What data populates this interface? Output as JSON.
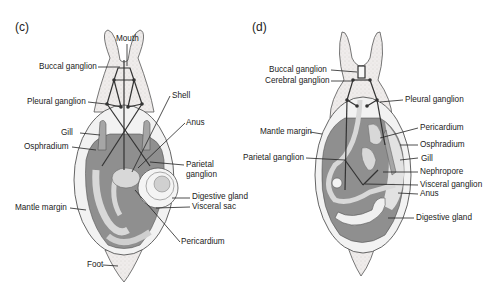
{
  "colors": {
    "body_fill": "#ece9e6",
    "mantle_dark": "#8a8a8a",
    "mantle_light": "#d6d6d6",
    "line": "#222222",
    "nerve": "#333333"
  },
  "panels": [
    {
      "id": "c",
      "label": "(c)",
      "labels": {
        "mouth": "Mouth",
        "buccal_ganglion": "Buccal ganglion",
        "pleural_ganglion": "Pleural ganglion",
        "shell": "Shell",
        "anus": "Anus",
        "gill": "Gill",
        "osphradium": "Osphradium",
        "parietal_ganglion_1": "Parietal",
        "parietal_ganglion_2": "ganglion",
        "digestive_gland": "Digestive gland",
        "visceral_sac": "Visceral sac",
        "mantle_margin": "Mantle margin",
        "pericardium": "Pericardium",
        "foot": "Foot"
      }
    },
    {
      "id": "d",
      "label": "(d)",
      "labels": {
        "buccal_ganglion": "Buccal ganglion",
        "cerebral_ganglion": "Cerebral ganglion",
        "pleural_ganglion": "Pleural ganglion",
        "mantle_margin": "Mantle margin",
        "pericardium": "Pericardium",
        "osphradium": "Osphradium",
        "parietal_ganglion": "Parietal ganglion",
        "gill": "Gill",
        "nephropore": "Nephropore",
        "visceral_ganglion": "Visceral ganglion",
        "anus": "Anus",
        "digestive_gland": "Digestive gland"
      }
    }
  ]
}
